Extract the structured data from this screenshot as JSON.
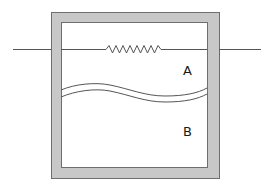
{
  "diagram": {
    "type": "schematic",
    "colors": {
      "wall_fill": "#c8c8c8",
      "wall_stroke": "#6e6e6e",
      "interior": "#ffffff",
      "line": "#555555",
      "label": "#1a1a1a"
    },
    "labels": {
      "chamber_a": "A",
      "chamber_b": "B"
    },
    "components": [
      {
        "name": "container-wall",
        "kind": "box"
      },
      {
        "name": "resistor",
        "kind": "zigzag",
        "zigzags": 9
      },
      {
        "name": "wire-left",
        "kind": "line"
      },
      {
        "name": "wire-right",
        "kind": "line"
      },
      {
        "name": "membrane",
        "kind": "double-wavy-line"
      }
    ]
  }
}
